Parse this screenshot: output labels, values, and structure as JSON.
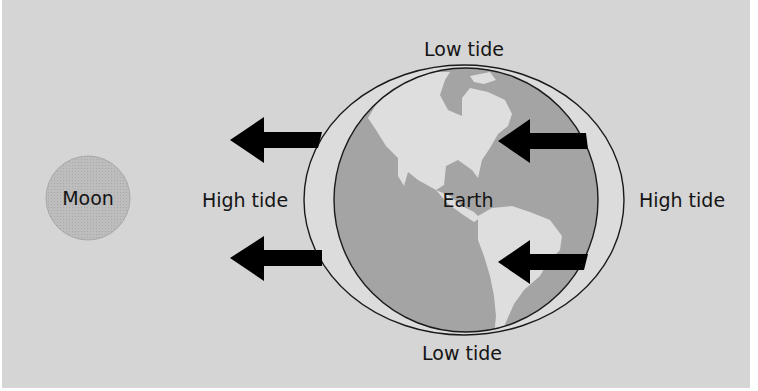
{
  "diagram": {
    "labels": {
      "moon": "Moon",
      "earth": "Earth",
      "low_tide_top": "Low tide",
      "low_tide_bottom": "Low tide",
      "high_tide_left": "High tide",
      "high_tide_right": "High tide"
    },
    "elements": {
      "moon": {
        "cx": 88,
        "cy": 198,
        "r": 42
      },
      "water_bulge": {
        "cx": 464,
        "cy": 200,
        "rx": 160,
        "ry": 135
      },
      "earth": {
        "cx": 466,
        "cy": 200,
        "r": 132
      },
      "arrows": [
        {
          "name": "left-upper",
          "tip_x": 230,
          "y": 140,
          "tail_x": 322,
          "direction": "left"
        },
        {
          "name": "left-lower",
          "tip_x": 230,
          "y": 258,
          "tail_x": 322,
          "direction": "left"
        },
        {
          "name": "earth-upper",
          "tip_x": 498,
          "y": 141,
          "tail_x": 588,
          "direction": "left"
        },
        {
          "name": "earth-lower",
          "tip_x": 498,
          "y": 262,
          "tail_x": 588,
          "direction": "left"
        }
      ]
    },
    "colors": {
      "background": "#d5d5d5",
      "moon_fill": "#b9b9b9",
      "water_fill": "#dcdcdc",
      "ocean_fill": "#a4a4a4",
      "land_fill": "#dedede",
      "arrow": "#000000",
      "text": "#141414"
    }
  }
}
